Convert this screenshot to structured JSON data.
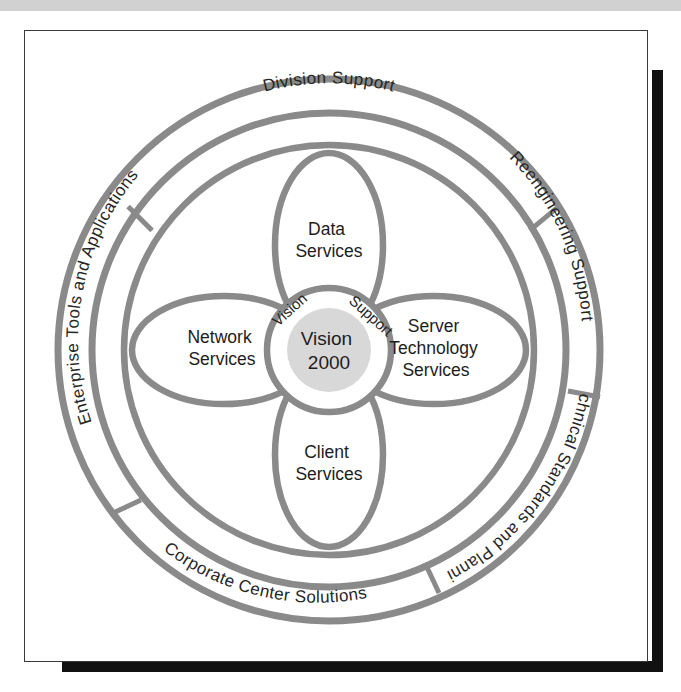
{
  "figure": {
    "title": "Vision 2000 services and support wheel",
    "hub": {
      "line1": "Vision",
      "line2": "2000"
    },
    "hub_spokes": [
      {
        "name": "vision-spoke",
        "label": "Vision"
      },
      {
        "name": "support-spoke",
        "label": "Support"
      }
    ],
    "petals": [
      {
        "name": "data-services",
        "line1": "Data",
        "line2": "Services",
        "line3": ""
      },
      {
        "name": "server-technology-services",
        "line1": "Server",
        "line2": "Technology",
        "line3": "Services"
      },
      {
        "name": "client-services",
        "line1": "Client",
        "line2": "Services",
        "line3": ""
      },
      {
        "name": "network-services",
        "line1": "Network",
        "line2": "Services",
        "line3": ""
      }
    ],
    "ring_segments": [
      {
        "name": "division-support",
        "label": "Division Support"
      },
      {
        "name": "reengineering-support",
        "label": "Reengineering Support"
      },
      {
        "name": "technical-standards-and-planning",
        "label": "Technical Standards and Planning"
      },
      {
        "name": "corporate-center-solutions",
        "label": "Corporate Center Solutions"
      },
      {
        "name": "enterprise-tools-and-applications",
        "label": "Enterprise Tools and Applications"
      }
    ],
    "colors": {
      "stroke": "#8a8a8a",
      "hub_fill": "#d8d8d8",
      "text": "#1d1d1d",
      "frame": "#3a3a3a",
      "shadow": "#111111",
      "scan_band": "#c9c9c9",
      "background": "#ffffff"
    }
  }
}
